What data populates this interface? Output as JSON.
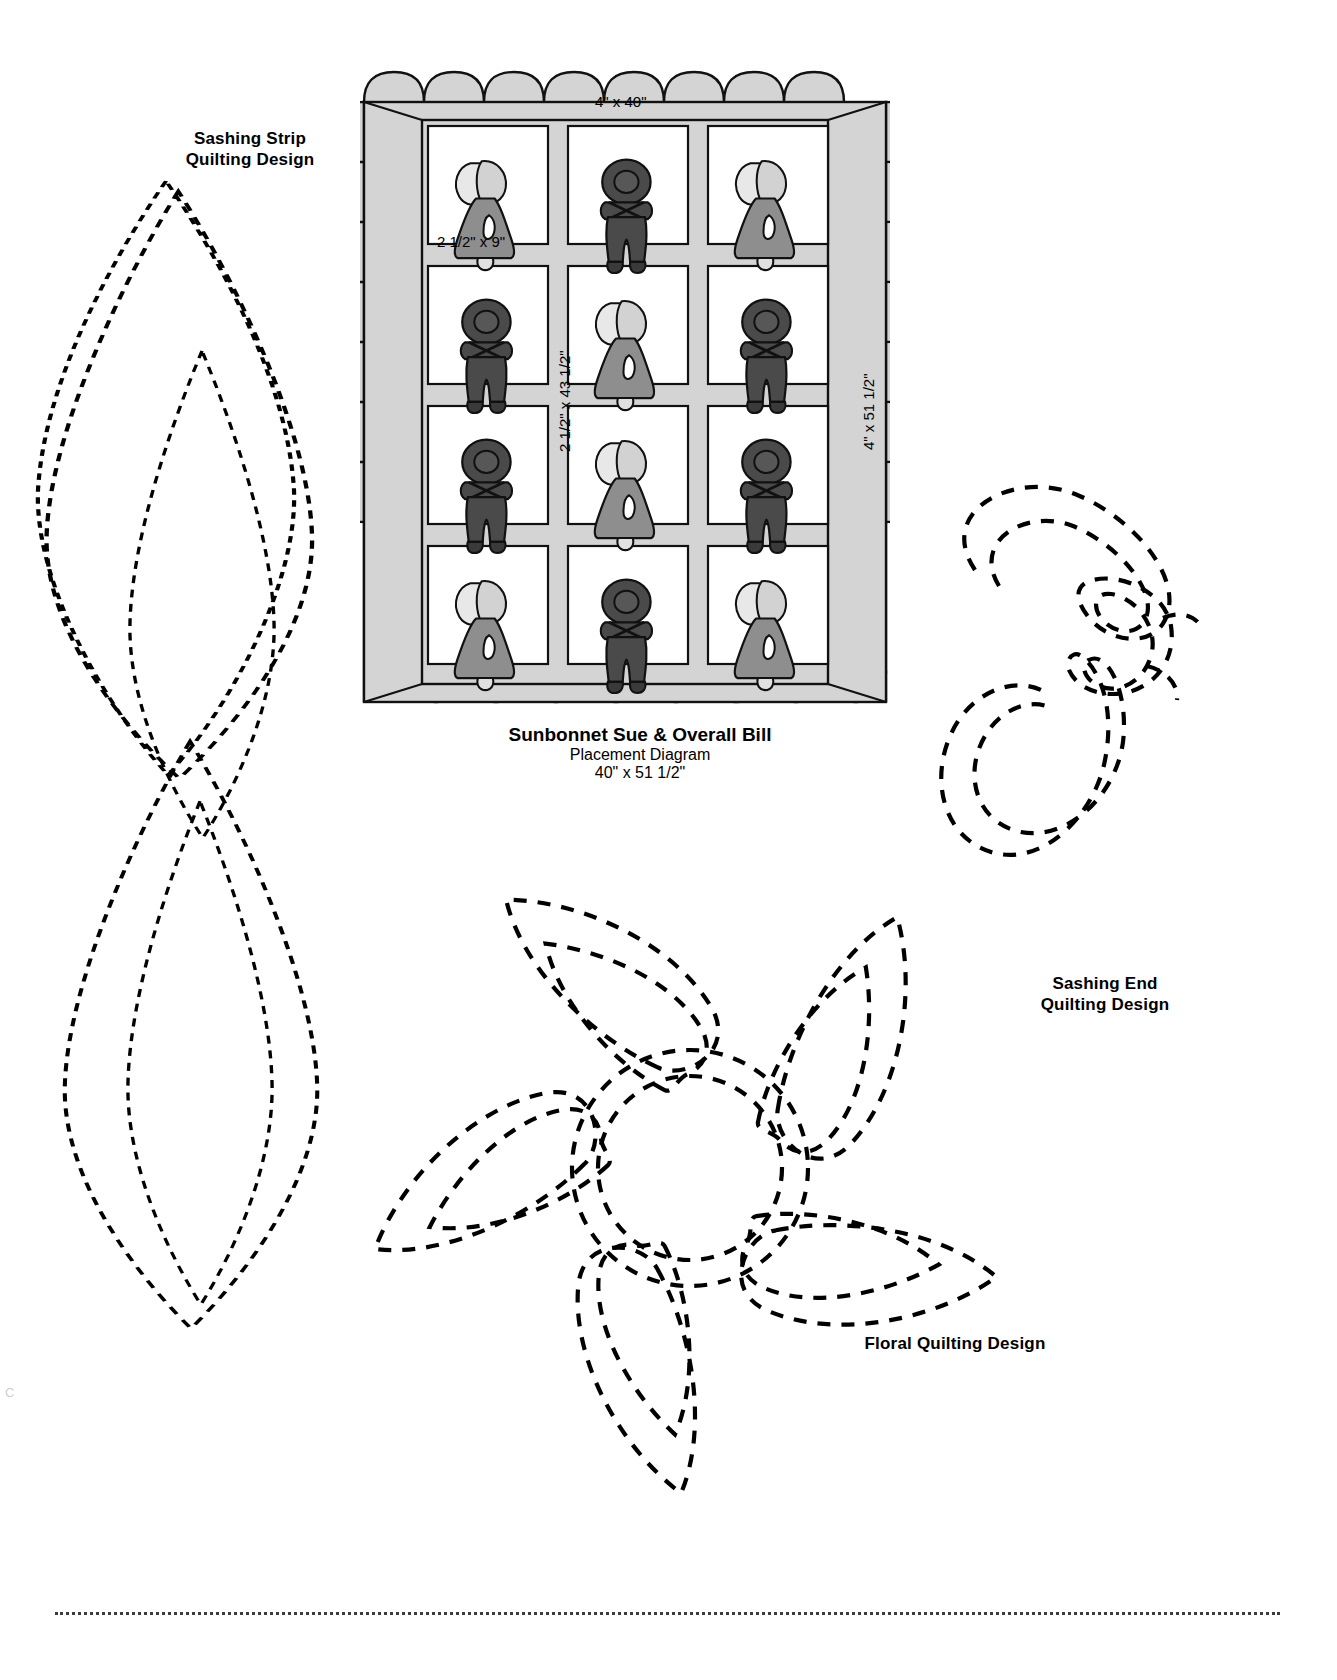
{
  "document": {
    "kind": "quilting-pattern-sheet",
    "background_color": "#ffffff"
  },
  "quilt": {
    "caption_title": "Sunbonnet Sue & Overall Bill",
    "caption_line_2": "Placement Diagram",
    "caption_line_3": "40\" x 51 1/2\"",
    "dimensions": {
      "top_border": "4\" x 40\"",
      "block_sashing_horizontal": "2 1/2\" x 9\"",
      "sashing_vertical": "2 1/2\" x 43 1/2\"",
      "side_border": "4\" x 51 1/2\""
    },
    "colors": {
      "border_fill": "#d4d4d4",
      "sashing_fill": "#d4d4d4",
      "block_fill": "#ffffff",
      "sue_dress": "#8e8e8e",
      "sue_bonnet": "#e8e8e8",
      "bill_body": "#4a4a4a",
      "outline": "#111111"
    },
    "grid": {
      "rows": 4,
      "cols": 3,
      "figures": [
        [
          "sue",
          "bill",
          "sue"
        ],
        [
          "bill",
          "sue",
          "bill"
        ],
        [
          "bill",
          "sue",
          "bill"
        ],
        [
          "sue",
          "bill",
          "sue"
        ]
      ]
    }
  },
  "designs": [
    {
      "id": "sashing-strip",
      "label": "Sashing Strip\nQuilting Design",
      "style": "dashed-stitch-line"
    },
    {
      "id": "sashing-end",
      "label": "Sashing End\nQuilting Design",
      "style": "dashed-stitch-line"
    },
    {
      "id": "floral",
      "label": "Floral Quilting Design",
      "style": "dashed-stitch-line"
    }
  ]
}
